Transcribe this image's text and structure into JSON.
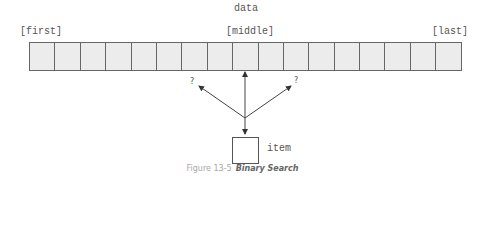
{
  "diagram": {
    "array_label": "data",
    "cell_count": 17,
    "index_labels": {
      "first": "[first]",
      "middle": "[middle]",
      "last": "[last]"
    },
    "arrow_labels": {
      "left": "?",
      "right": "?"
    },
    "item_label": "item"
  },
  "caption": {
    "number": "Figure 13-5",
    "title": "Binary Search"
  },
  "colors": {
    "cell_fill": "#ececec",
    "stroke": "#555555",
    "caption_number": "#a8a8a8",
    "caption_title": "#666666"
  }
}
